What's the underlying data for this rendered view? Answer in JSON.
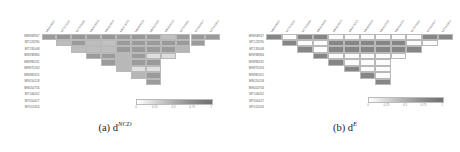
{
  "figure": {
    "panels": [
      {
        "id": "a",
        "caption_prefix": "(a)",
        "caption_symbol": "d",
        "caption_superscript": "NCD",
        "caption_full": "(a) d^NCD"
      },
      {
        "id": "b",
        "caption_prefix": "(b)",
        "caption_symbol": "d",
        "caption_superscript": "E",
        "caption_full": "(b) d^E"
      }
    ]
  },
  "colorbar": {
    "ticks": [
      "0",
      "0.25",
      "0.5",
      "0.75",
      "1"
    ],
    "tick_values": [
      0,
      0.25,
      0.5,
      0.75,
      1
    ],
    "min": 0,
    "max": 1,
    "low_color": "#ffffff",
    "high_color": "#727272",
    "orientation": "horizontal"
  },
  "chart_data": [
    {
      "type": "heatmap",
      "title": "(a) d^NCD",
      "panel": "a",
      "xlabel": "",
      "ylabel": "",
      "triangle": "upper",
      "grid": true,
      "legend": "horizontal colorbar, inside lower-right",
      "zlim": [
        0,
        1
      ],
      "categories": [
        "MN908947",
        "MT123290",
        "MT135048",
        "MN938384",
        "MN996531",
        "MN975263",
        "MN985325",
        "MN150118",
        "MN054756",
        "MT106052",
        "MT050417",
        "MT012416"
      ],
      "row_labels": [
        "MN908947",
        "MT123290",
        "MT135048",
        "MN938384",
        "MN996531",
        "MN975263",
        "MN985325",
        "MN150118",
        "MN054756",
        "MT106052",
        "MT050417",
        "MT012416"
      ],
      "col_labels": [
        "MN908947",
        "MT123290",
        "MT135048",
        "MN938384",
        "MN996531",
        "MN975263",
        "MN985325",
        "MN150118",
        "MN054756",
        "MT106052",
        "MT050417",
        "MT012416"
      ],
      "values": [
        [
          0.62,
          0.66,
          0.64,
          0.63,
          0.65,
          0.62,
          0.64,
          0.63,
          0.38,
          0.62,
          0.63,
          0.63
        ],
        [
          null,
          0.4,
          0.63,
          0.4,
          0.38,
          0.62,
          0.63,
          0.62,
          0.63,
          0.62,
          0.62,
          null
        ],
        [
          null,
          null,
          0.41,
          0.4,
          0.4,
          0.63,
          0.63,
          0.62,
          0.63,
          0.45,
          null,
          null
        ],
        [
          null,
          null,
          null,
          0.62,
          0.62,
          0.43,
          0.62,
          0.22,
          0.22,
          null,
          null,
          null
        ],
        [
          null,
          null,
          null,
          null,
          0.62,
          0.43,
          0.62,
          0.62,
          null,
          null,
          null,
          null
        ],
        [
          null,
          null,
          null,
          null,
          null,
          0.43,
          0.2,
          0.2,
          null,
          null,
          null,
          null
        ],
        [
          null,
          null,
          null,
          null,
          null,
          null,
          0.44,
          0.62,
          null,
          null,
          null,
          null
        ],
        [
          null,
          null,
          null,
          null,
          null,
          null,
          null,
          0.62,
          null,
          null,
          null,
          null
        ],
        [
          null,
          null,
          null,
          null,
          null,
          null,
          null,
          null,
          null,
          null,
          null,
          null
        ],
        [
          null,
          null,
          null,
          null,
          null,
          null,
          null,
          null,
          null,
          null,
          null,
          null
        ],
        [
          null,
          null,
          null,
          null,
          null,
          null,
          null,
          null,
          null,
          null,
          null,
          null
        ],
        [
          null,
          null,
          null,
          null,
          null,
          null,
          null,
          null,
          null,
          null,
          null,
          null
        ]
      ]
    },
    {
      "type": "heatmap",
      "title": "(b) d^E",
      "panel": "b",
      "xlabel": "",
      "ylabel": "",
      "triangle": "upper",
      "grid": true,
      "legend": "horizontal colorbar, inside lower-right",
      "zlim": [
        0,
        1
      ],
      "categories": [
        "MN908947",
        "MT123290",
        "MT135048",
        "MN938384",
        "MN996531",
        "MN975263",
        "MN985325",
        "MN150118",
        "MN054756",
        "MT106052",
        "MT050417",
        "MT012416"
      ],
      "row_labels": [
        "MN908947",
        "MT123290",
        "MT135048",
        "MN938384",
        "MN996531",
        "MN975263",
        "MN985325",
        "MN150118",
        "MN054756",
        "MT106052",
        "MT050417",
        "MT012416"
      ],
      "col_labels": [
        "MN908947",
        "MT123290",
        "MT135048",
        "MN938384",
        "MN996531",
        "MN975263",
        "MN985325",
        "MN150118",
        "MN054756",
        "MT106052",
        "MT050417",
        "MT012416"
      ],
      "values": [
        [
          0.78,
          0.02,
          0.78,
          0.78,
          0.02,
          0.02,
          0.02,
          0.02,
          0.02,
          0.02,
          0.78,
          0.78
        ],
        [
          null,
          0.78,
          0.02,
          0.02,
          0.78,
          0.78,
          0.78,
          0.78,
          0.78,
          0.02,
          0.02,
          null
        ],
        [
          null,
          null,
          0.78,
          0.02,
          0.78,
          0.78,
          0.78,
          0.78,
          0.78,
          0.78,
          null,
          null
        ],
        [
          null,
          null,
          null,
          0.78,
          0.02,
          0.02,
          0.02,
          0.02,
          0.02,
          null,
          null,
          null
        ],
        [
          null,
          null,
          null,
          null,
          0.78,
          0.02,
          0.02,
          0.02,
          null,
          null,
          null,
          null
        ],
        [
          null,
          null,
          null,
          null,
          null,
          0.78,
          0.02,
          0.02,
          null,
          null,
          null,
          null
        ],
        [
          null,
          null,
          null,
          null,
          null,
          null,
          0.78,
          0.02,
          null,
          null,
          null,
          null
        ],
        [
          null,
          null,
          null,
          null,
          null,
          null,
          null,
          0.78,
          null,
          null,
          null,
          null
        ],
        [
          null,
          null,
          null,
          null,
          null,
          null,
          null,
          null,
          null,
          null,
          null,
          null
        ],
        [
          null,
          null,
          null,
          null,
          null,
          null,
          null,
          null,
          null,
          null,
          null,
          null
        ],
        [
          null,
          null,
          null,
          null,
          null,
          null,
          null,
          null,
          null,
          null,
          null,
          null
        ],
        [
          null,
          null,
          null,
          null,
          null,
          null,
          null,
          null,
          null,
          null,
          null,
          null
        ]
      ]
    }
  ]
}
